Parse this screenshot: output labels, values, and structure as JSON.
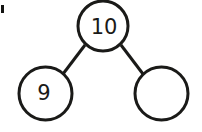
{
  "figure": {
    "kind": "number-bond",
    "width": 202,
    "height": 132,
    "background_color": "#ffffff",
    "stroke_color": "#1a1a18",
    "text_color": "#1a1a18",
    "stroke_width": 3,
    "nodes": {
      "whole": {
        "label": "10",
        "role": "whole",
        "filled": true,
        "cx": 103,
        "cy": 26,
        "r": 25,
        "font_size": 21,
        "text_x": 104,
        "text_y": 28
      },
      "part_left": {
        "label": "9",
        "role": "part",
        "filled": true,
        "cx": 45.5,
        "cy": 93.5,
        "r": 26.5,
        "font_size": 21,
        "text_x": 44,
        "text_y": 94
      },
      "part_right": {
        "label": "",
        "role": "part",
        "filled": false,
        "cx": 161.5,
        "cy": 93.5,
        "r": 26.5,
        "font_size": 21,
        "text_x": 161,
        "text_y": 94
      }
    },
    "connectors": [
      {
        "name": "whole-to-left-part",
        "x1": 85,
        "y1": 45,
        "x2": 63,
        "y2": 74
      },
      {
        "name": "whole-to-right-part",
        "x1": 121,
        "y1": 45,
        "x2": 143,
        "y2": 74
      }
    ],
    "artifact": {
      "name": "scan-edge-mark",
      "x": 1,
      "y": 5,
      "width": 3,
      "height": 8
    }
  }
}
